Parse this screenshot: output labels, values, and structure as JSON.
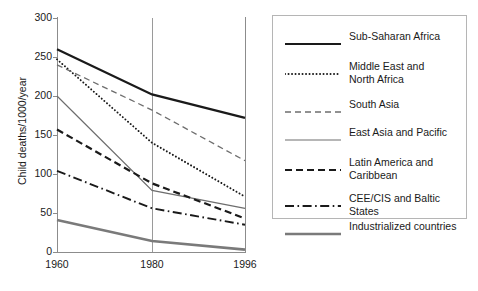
{
  "chart_data": {
    "type": "line",
    "title": "",
    "xlabel": "",
    "ylabel": "Child deaths/1000/year",
    "x": [
      1960,
      1980,
      1996
    ],
    "xtick_labels": [
      "1960",
      "1980",
      "1996"
    ],
    "ytick_labels": [
      "0",
      "50",
      "100",
      "150",
      "200",
      "250",
      "300"
    ],
    "ytick_values": [
      0,
      50,
      100,
      150,
      200,
      250,
      300
    ],
    "ylim": [
      0,
      300
    ],
    "grid": "vertical gridline at 1980",
    "legend_position": "right",
    "series": [
      {
        "name": "Sub-Saharan Africa",
        "values": [
          260,
          202,
          172
        ],
        "style": "solid",
        "color": "#1a1a1a",
        "width": 2.2
      },
      {
        "name": "Middle East and North Africa",
        "values": [
          247,
          140,
          71
        ],
        "style": "dotted",
        "color": "#1a1a1a",
        "width": 1.9
      },
      {
        "name": "South Asia",
        "values": [
          240,
          182,
          117
        ],
        "style": "dashed",
        "color": "#6e6e6e",
        "width": 1.3
      },
      {
        "name": "East Asia and Pacific",
        "values": [
          200,
          79,
          56
        ],
        "style": "solid-thin",
        "color": "#6e6e6e",
        "width": 1.2
      },
      {
        "name": "Latin America and Caribbean",
        "values": [
          157,
          88,
          43
        ],
        "style": "dashed-bold",
        "color": "#1a1a1a",
        "width": 2.2
      },
      {
        "name": "CEE/CIS and Baltic States",
        "values": [
          104,
          56,
          35
        ],
        "style": "dash-dot",
        "color": "#1a1a1a",
        "width": 1.9
      },
      {
        "name": "Industrialized countries",
        "values": [
          41,
          14,
          3
        ],
        "style": "solid-gray",
        "color": "#7a7a7a",
        "width": 2.6
      }
    ]
  },
  "legend": {
    "entries": [
      {
        "label": "Sub-Saharan Africa"
      },
      {
        "label": "Middle East and\nNorth Africa"
      },
      {
        "label": "South Asia"
      },
      {
        "label": "East Asia and Pacific"
      },
      {
        "label": "Latin America and\nCaribbean"
      },
      {
        "label": "CEE/CIS and Baltic States"
      },
      {
        "label": "Industrialized countries"
      }
    ]
  },
  "colors": {
    "axis": "#8c8c8c",
    "gridline": "#9a9a9a",
    "legend_border": "#b5b5b5",
    "text": "#1a1a1a",
    "gray_series": "#6e6e6e",
    "industrialized": "#7a7a7a"
  }
}
